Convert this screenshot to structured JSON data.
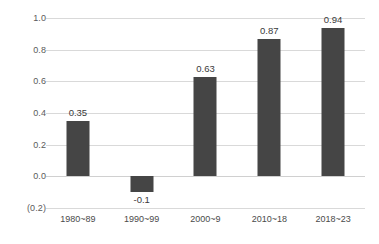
{
  "chart_data": {
    "type": "bar",
    "title": "",
    "subtitle": "",
    "xlabel": "",
    "ylabel": "",
    "categories": [
      "1980~89",
      "1990~99",
      "2000~9",
      "2010~18",
      "2018~23"
    ],
    "values": [
      0.35,
      -0.1,
      0.63,
      0.87,
      0.94
    ],
    "value_labels": [
      "0.35",
      "-0.1",
      "0.63",
      "0.87",
      "0.94"
    ],
    "ylim": [
      -0.2,
      1.0
    ],
    "ytick_values": [
      1.0,
      0.8,
      0.6,
      0.4,
      0.2,
      0.0,
      -0.2
    ],
    "ytick_labels": [
      "1.0",
      "0.8",
      "0.6",
      "0.4",
      "0.2",
      "0.0",
      "(0.2)"
    ],
    "grid": true,
    "legend": "none",
    "bar_color": "#454545",
    "gridline_color": "#d9d9d9",
    "background_color": "#ffffff",
    "label_color": "#3a3a3a"
  }
}
